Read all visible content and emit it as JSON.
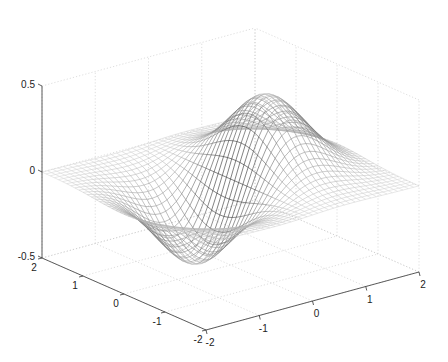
{
  "chart_data": {
    "type": "surface-mesh",
    "title": "",
    "function": "z = x * exp(-x^2 - y^2)",
    "x": {
      "label": "",
      "range": [
        -2,
        2
      ],
      "ticks": [
        -2,
        -1,
        0,
        1,
        2
      ],
      "tick_labels": [
        "-2",
        "-1",
        "0",
        "1",
        "2"
      ]
    },
    "y": {
      "label": "",
      "range": [
        -2,
        2
      ],
      "ticks": [
        -2,
        -1,
        0,
        1,
        2
      ],
      "tick_labels": [
        "-2",
        "-1",
        "0",
        "1",
        "2"
      ]
    },
    "z": {
      "label": "",
      "range": [
        -0.5,
        0.5
      ],
      "ticks": [
        -0.5,
        0,
        0.5
      ],
      "tick_labels": [
        "-0.5",
        "0",
        "0.5"
      ]
    },
    "grid": true,
    "mesh_resolution": 41,
    "peak": {
      "x": 0.71,
      "y": 0,
      "z": 0.43
    },
    "trough": {
      "x": -0.71,
      "y": 0,
      "z": -0.43
    },
    "legend": null
  },
  "style": {
    "background": "#ffffff",
    "axis_color": "#333333",
    "grid_color": "#c8c8c8",
    "mesh_color_dark": "#1a1a1a",
    "mesh_color_light": "#d8d8d8"
  },
  "projection": {
    "origin_front": [
      206,
      330
    ],
    "x_axis_end": [
      419,
      272
    ],
    "y_axis_end": [
      42,
      258
    ],
    "z_scale_px_per_unit": 172
  }
}
